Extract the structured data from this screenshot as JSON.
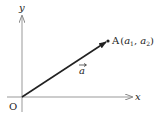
{
  "diagram": {
    "axes": {
      "x_label": "x",
      "y_label": "y",
      "origin_label": "O"
    },
    "vector": {
      "name": "a",
      "from": "O",
      "to": "A"
    },
    "point": {
      "name": "A",
      "coord_open": "(",
      "a1_base": "a",
      "a1_sub": "1",
      "sep": ", ",
      "a2_base": "a",
      "a2_sub": "2",
      "coord_close": ")"
    },
    "colors": {
      "axis": "#888888",
      "vector": "#222222",
      "text": "#222222"
    }
  }
}
